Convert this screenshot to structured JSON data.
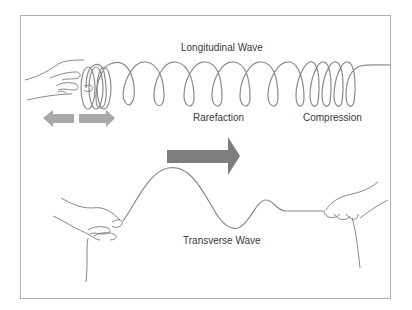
{
  "diagram": {
    "labels": {
      "longitudinal": "Longitudinal Wave",
      "rarefaction": "Rarefaction",
      "compression": "Compression",
      "transverse": "Transverse Wave"
    },
    "colors": {
      "frame": "#b0b0b0",
      "line": "#8a8a8a",
      "arrow_small": "#a8a8a8",
      "arrow_big": "#7d7d7d",
      "text": "#3a3a3a",
      "hand": "#6a6a6a"
    },
    "arrows": {
      "push_pull": [
        "left",
        "right"
      ],
      "propagation": "right"
    }
  }
}
